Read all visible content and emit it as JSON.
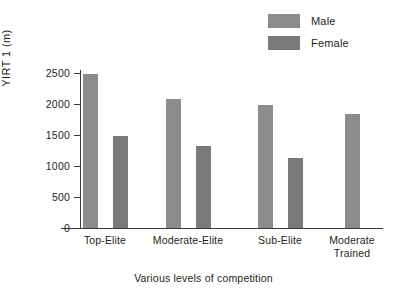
{
  "chart_data": {
    "type": "bar",
    "title": "",
    "subtitle": "",
    "xlabel": "Various levels of competition",
    "ylabel": "YIRT 1 (m)",
    "categories": [
      "Top-Elite",
      "Moderate-Elite",
      "Sub-Elite",
      "Moderate\nTrained"
    ],
    "series": [
      {
        "name": "Male",
        "color": "#8c8c8c",
        "values": [
          2490,
          2080,
          1985,
          1840
        ]
      },
      {
        "name": "Female",
        "color": "#7a7a7a",
        "values": [
          1490,
          1325,
          1130,
          null
        ]
      }
    ],
    "ylim": [
      0,
      2500
    ],
    "ytick_labels": [
      "2500",
      "2000",
      "1500",
      "1000",
      "500",
      "0"
    ],
    "ytick_values": [
      2500,
      2000,
      1500,
      1000,
      500,
      0
    ],
    "grid": false,
    "legend_position": "top-right"
  },
  "legend": {
    "items": [
      {
        "label": "Male"
      },
      {
        "label": "Female"
      }
    ]
  },
  "axis": {
    "y_title": "YIRT 1 (m)",
    "x_title": "Various levels of competition",
    "y_ticks": [
      "2500",
      "2000",
      "1500",
      "1000",
      "500",
      "0"
    ]
  },
  "categories": {
    "c0": "Top-Elite",
    "c1": "Moderate-Elite",
    "c2": "Sub-Elite",
    "c3": "Moderate\nTrained"
  },
  "colors": {
    "male": "#8c8c8c",
    "female": "#7a7a7a",
    "axis": "#3a3a3a",
    "text": "#231f20",
    "background": "#ffffff"
  }
}
